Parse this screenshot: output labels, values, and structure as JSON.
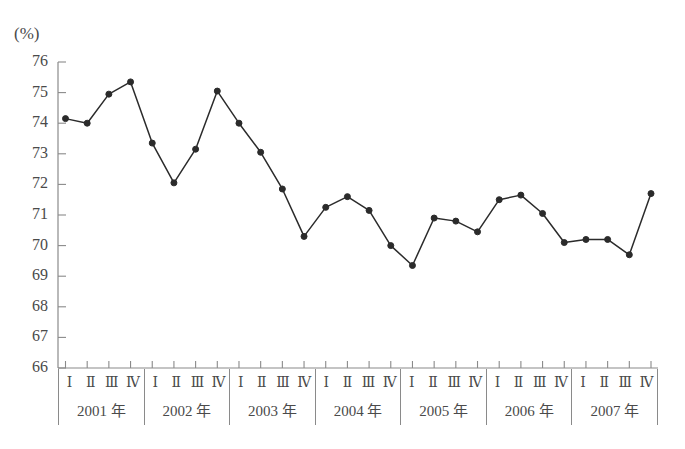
{
  "chart_data": {
    "type": "line",
    "title": "",
    "subtitle": "",
    "xlabel": "",
    "ylabel": "(%)",
    "unit_label": "(%)",
    "ylim": [
      66,
      76
    ],
    "ytick_labels": [
      "76",
      "75",
      "74",
      "73",
      "72",
      "71",
      "70",
      "69",
      "68",
      "67",
      "66"
    ],
    "yticks": [
      76,
      75,
      74,
      73,
      72,
      71,
      70,
      69,
      68,
      67,
      66
    ],
    "grid": false,
    "legend": "none",
    "marker": "filled-circle",
    "line_color": "#2b2b2b",
    "axis_color": "#8a8a8a",
    "text_color": "#4a4a4a",
    "years": [
      "2001 年",
      "2002 年",
      "2003 年",
      "2004 年",
      "2005 年",
      "2006 年",
      "2007 年"
    ],
    "quarters": [
      "Ⅰ",
      "Ⅱ",
      "Ⅲ",
      "Ⅳ"
    ],
    "categories": [
      "2001 I",
      "2001 II",
      "2001 III",
      "2001 IV",
      "2002 I",
      "2002 II",
      "2002 III",
      "2002 IV",
      "2003 I",
      "2003 II",
      "2003 III",
      "2003 IV",
      "2004 I",
      "2004 II",
      "2004 III",
      "2004 IV",
      "2005 I",
      "2005 II",
      "2005 III",
      "2005 IV",
      "2006 I",
      "2006 II",
      "2006 III",
      "2006 IV",
      "2007 I",
      "2007 II",
      "2007 III",
      "2007 IV"
    ],
    "values": [
      74.15,
      74.0,
      74.95,
      75.35,
      73.35,
      72.05,
      73.15,
      75.05,
      74.0,
      73.05,
      71.85,
      70.3,
      71.25,
      71.6,
      71.15,
      70.0,
      69.35,
      70.9,
      70.8,
      70.45,
      71.5,
      71.65,
      71.05,
      70.1,
      70.2,
      70.2,
      69.7,
      71.7
    ]
  }
}
